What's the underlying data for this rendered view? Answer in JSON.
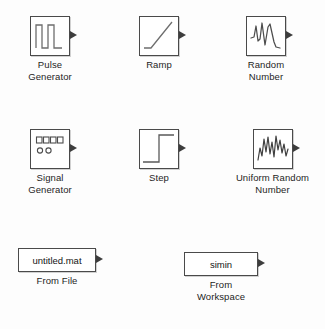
{
  "palette": {
    "name": "simulink-sources-library",
    "background": "#fdfdfd",
    "line_color": "#4a4a4a",
    "text_color": "#1d1d1d"
  },
  "blocks": [
    {
      "id": "pulse-generator",
      "icon": "pulse-waveform-icon",
      "caption": "Pulse\nGenerator",
      "x": 30,
      "y": 16,
      "w": 40,
      "h": 40,
      "port_label": "output-port"
    },
    {
      "id": "ramp",
      "icon": "ramp-waveform-icon",
      "caption": "Ramp",
      "x": 139,
      "y": 16,
      "w": 40,
      "h": 40,
      "port_label": "output-port"
    },
    {
      "id": "random-number",
      "icon": "random-waveform-icon",
      "caption": "Random\nNumber",
      "x": 243,
      "y": 16,
      "w": 40,
      "h": 40,
      "port_label": "output-port"
    },
    {
      "id": "signal-generator",
      "icon": "signal-generator-panel-icon",
      "caption": "Signal\nGenerator",
      "x": 30,
      "y": 129,
      "w": 40,
      "h": 40,
      "port_label": "output-port"
    },
    {
      "id": "step",
      "icon": "step-waveform-icon",
      "caption": "Step",
      "x": 139,
      "y": 129,
      "w": 40,
      "h": 40,
      "port_label": "output-port"
    },
    {
      "id": "uniform-random-number",
      "icon": "uniform-random-waveform-icon",
      "caption": "Uniform Random\nNumber",
      "x": 243,
      "y": 129,
      "w": 40,
      "h": 40,
      "port_label": "output-port"
    }
  ],
  "text_blocks": [
    {
      "id": "from-file",
      "value": "untitled.mat",
      "caption": "From File",
      "x": 18,
      "y": 248,
      "w": 78,
      "h": 24,
      "port_label": "output-port"
    },
    {
      "id": "from-workspace",
      "value": "simin",
      "caption": "From\nWorkspace",
      "x": 184,
      "y": 252,
      "w": 74,
      "h": 24,
      "port_label": "output-port"
    }
  ]
}
